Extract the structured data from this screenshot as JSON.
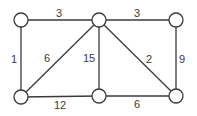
{
  "graph": {
    "type": "weighted-undirected-graph",
    "node_radius": 7,
    "colors": {
      "stroke": "#3a3a3a",
      "fill": "#ffffff",
      "text": "#3a3a3a"
    },
    "nodes": [
      {
        "id": "A",
        "x": 21,
        "y": 20
      },
      {
        "id": "B",
        "x": 99,
        "y": 20
      },
      {
        "id": "C",
        "x": 176,
        "y": 20
      },
      {
        "id": "D",
        "x": 21,
        "y": 97
      },
      {
        "id": "E",
        "x": 99,
        "y": 96
      },
      {
        "id": "F",
        "x": 176,
        "y": 96
      }
    ],
    "edges": [
      {
        "from": "A",
        "to": "B",
        "weight": "3",
        "lx": 59,
        "ly": 17
      },
      {
        "from": "B",
        "to": "C",
        "weight": "3",
        "lx": 137,
        "ly": 17
      },
      {
        "from": "A",
        "to": "D",
        "weight": "1",
        "lx": 14,
        "ly": 63
      },
      {
        "from": "D",
        "to": "B",
        "weight": "6",
        "lx": 47,
        "ly": 62
      },
      {
        "from": "B",
        "to": "E",
        "weight": "15",
        "lx": 89,
        "ly": 62
      },
      {
        "from": "B",
        "to": "F",
        "weight": "2",
        "lx": 149,
        "ly": 63
      },
      {
        "from": "C",
        "to": "F",
        "weight": "9",
        "lx": 182,
        "ly": 63
      },
      {
        "from": "D",
        "to": "E",
        "weight": "12",
        "lx": 60,
        "ly": 109
      },
      {
        "from": "E",
        "to": "F",
        "weight": "6",
        "lx": 137,
        "ly": 108
      }
    ]
  }
}
